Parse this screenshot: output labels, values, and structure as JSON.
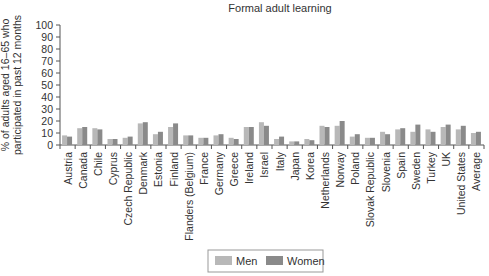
{
  "chart_data": {
    "type": "bar",
    "title": "Formal adult learning",
    "xlabel": "",
    "ylabel": "% of adults aged 16–65 who participated in past 12 months",
    "ylim": [
      0,
      100
    ],
    "yticks": [
      0,
      10,
      20,
      30,
      40,
      50,
      60,
      70,
      80,
      90,
      100
    ],
    "grid": false,
    "legend_position": "bottom-center",
    "categories": [
      "Austria",
      "Canada",
      "Chile",
      "Cyprus",
      "Czech Republic",
      "Denmark",
      "Estonia",
      "Finland",
      "Flanders (Belgium)",
      "France",
      "Germany",
      "Greece",
      "Ireland",
      "Israel",
      "Italy",
      "Japan",
      "Korea",
      "Netherlands",
      "Norway",
      "Poland",
      "Slovak Republic",
      "Slovenia",
      "Spain",
      "Sweden",
      "Turkey",
      "UK",
      "United States",
      "Average"
    ],
    "series": [
      {
        "name": "Men",
        "color": "#b8b8b8",
        "values": [
          8,
          14,
          14,
          5,
          6,
          18,
          9,
          15,
          8,
          6,
          8,
          6,
          15,
          19,
          5,
          3,
          5,
          16,
          16,
          7,
          6,
          11,
          13,
          11,
          13,
          15,
          13,
          10
        ]
      },
      {
        "name": "Women",
        "color": "#8a8a8a",
        "values": [
          7,
          15,
          13,
          5,
          7,
          19,
          11,
          18,
          8,
          6,
          9,
          5,
          15,
          16,
          7,
          3,
          4,
          15,
          20,
          9,
          6,
          9,
          14,
          17,
          11,
          17,
          16,
          11
        ]
      }
    ]
  }
}
